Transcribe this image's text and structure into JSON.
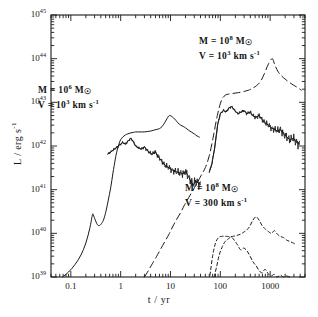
{
  "figure": {
    "title": "",
    "background_color": "#ffffff",
    "line_color": "#1a1a1a"
  },
  "axes": {
    "x": {
      "label": "t / yr",
      "scale": "log",
      "min": 0.04,
      "max": 5000,
      "tick_labels": [
        "0.1",
        "1",
        "10",
        "100",
        "1000"
      ],
      "tick_values": [
        0.1,
        1,
        10,
        100,
        1000
      ]
    },
    "y": {
      "label": "L / erg s",
      "label_exponent": "-1",
      "scale": "log",
      "min": 1e+39,
      "max": 1e+45,
      "tick_labels": [
        "10",
        "10",
        "10",
        "10",
        "10",
        "10",
        "10"
      ],
      "tick_exponents": [
        "39",
        "40",
        "41",
        "42",
        "43",
        "44",
        "45"
      ],
      "tick_values": [
        1e+39,
        1e+40,
        1e+41,
        1e+42,
        1e+43,
        1e+44,
        1e+45
      ]
    }
  },
  "annotations": [
    {
      "id": "left-model",
      "mass_prefix": "M  =  10",
      "mass_exponent": "6",
      "mass_unit": "M",
      "mass_unit_sub": "☉",
      "velocity_prefix": "V  =  10",
      "velocity_exponent": "3",
      "velocity_unit": "km s",
      "velocity_unit_exponent": "-1"
    },
    {
      "id": "top-right-model",
      "mass_prefix": "M  =  10",
      "mass_exponent": "8",
      "mass_unit": "M",
      "mass_unit_sub": "☉",
      "velocity_prefix": "V  =  10",
      "velocity_exponent": "3",
      "velocity_unit": "km s",
      "velocity_unit_exponent": "-1"
    },
    {
      "id": "lower-right-model",
      "mass_prefix": "M  =  10",
      "mass_exponent": "8",
      "mass_unit": "M",
      "mass_unit_sub": "☉",
      "velocity_prefix": "V  =  300",
      "velocity_exponent": "",
      "velocity_unit": "km s",
      "velocity_unit_exponent": "-1"
    }
  ],
  "chart_data": {
    "type": "line",
    "title": "",
    "xlabel": "t / yr",
    "ylabel": "L / erg s^-1",
    "xscale": "log",
    "yscale": "log",
    "xlim": [
      0.04,
      5000
    ],
    "ylim": [
      1e+39,
      1e+45
    ],
    "grid": false,
    "legend": "none (inline text annotations)",
    "series": [
      {
        "name": "M=1e6 Msun, V=1e3 km/s (smooth rise, solid)",
        "style": "solid",
        "x": [
          0.068,
          0.09,
          0.12,
          0.16,
          0.2,
          0.24,
          0.27,
          0.28,
          0.3,
          0.33,
          0.36,
          0.4,
          0.45,
          0.5,
          0.56,
          0.63,
          0.7,
          0.78,
          0.85,
          0.92,
          1.0,
          1.1,
          1.25,
          1.4,
          1.6,
          1.8,
          2.0,
          2.3,
          2.6,
          3.0,
          3.5,
          4.0,
          4.6,
          5.3,
          6.0,
          6.8,
          7.6,
          8.5,
          9.5,
          11,
          12,
          13,
          14,
          16,
          18,
          20,
          23,
          26,
          30,
          34,
          38
        ],
        "y": [
          1e+39,
          1.3e+39,
          1.9e+39,
          3.2e+39,
          6e+39,
          1.3e+40,
          2.6e+40,
          2.7e+40,
          2.2e+40,
          1.7e+40,
          1.5e+40,
          1.6e+40,
          2e+40,
          3e+40,
          5.5e+40,
          1.1e+41,
          2.4e+41,
          5e+41,
          8e+41,
          1.1e+42,
          1.4e+42,
          1.6e+42,
          1.8e+42,
          1.9e+42,
          2e+42,
          2.05e+42,
          2.1e+42,
          2.1e+42,
          2.1e+42,
          2.1e+42,
          2.15e+42,
          2.2e+42,
          2.3e+42,
          2.4e+42,
          2.5e+42,
          2.8e+42,
          3.4e+42,
          4.2e+42,
          5e+42,
          4.6e+42,
          4.2e+42,
          3.8e+42,
          3.4e+42,
          3e+42,
          2.8e+42,
          2.6e+42,
          2.3e+42,
          2.1e+42,
          1.9e+42,
          1.7e+42,
          1.6e+42
        ]
      },
      {
        "name": "M=1e6 Msun, V=1e3 km/s (jagged, solid)",
        "style": "solid-jagged",
        "x": [
          0.55,
          0.65,
          0.75,
          0.85,
          0.95,
          1.1,
          1.25,
          1.4,
          1.6,
          1.8,
          2.0,
          2.3,
          2.6,
          3.0,
          3.4,
          3.8,
          4.3,
          4.9,
          5.5,
          6.2,
          7.0,
          7.8,
          8.8,
          10,
          11,
          12.5,
          14,
          16,
          18,
          20,
          23,
          26,
          29,
          32,
          36,
          40
        ],
        "y": [
          6.5e+41,
          7.5e+41,
          8.5e+41,
          9.5e+41,
          1.05e+42,
          1.2e+42,
          1.1e+42,
          1.3e+42,
          1.5e+42,
          1.25e+42,
          1e+42,
          9e+41,
          8.5e+41,
          9.5e+41,
          8e+41,
          7e+41,
          6.5e+41,
          7.5e+41,
          6e+41,
          5e+41,
          4.2e+41,
          3.6e+41,
          3.3e+41,
          3e+41,
          2.8e+41,
          2.6e+41,
          2.5e+41,
          2.4e+41,
          2.3e+41,
          2.6e+41,
          2e+41,
          1.5e+41,
          1.3e+41,
          1.6e+41,
          1.4e+41,
          1.3e+41
        ]
      },
      {
        "name": "M=1e8 Msun, V=1e3 km/s (long-dashed)",
        "style": "long-dashed",
        "x": [
          3.0,
          3.6,
          4.3,
          5.2,
          6.3,
          7.6,
          9.2,
          11,
          13,
          16,
          19,
          23,
          28,
          34,
          41,
          50,
          60,
          72,
          87,
          105,
          125,
          150,
          180,
          215,
          260,
          310,
          370,
          440,
          530,
          640,
          770,
          920,
          1100,
          1250,
          1450,
          1700,
          2000,
          2400,
          2900,
          3500,
          4200
        ],
        "y": [
          1e+39,
          1.4e+39,
          2e+39,
          2.9e+39,
          4.3e+39,
          6.3e+39,
          9.3e+39,
          1.4e+40,
          2e+40,
          3e+40,
          4.4e+40,
          6.5e+40,
          9.5e+40,
          1.4e+41,
          2.1e+41,
          3.2e+41,
          6e+41,
          1.6e+42,
          5e+42,
          1.1e+43,
          1.45e+43,
          1.55e+43,
          1.6e+43,
          1.65e+43,
          1.7e+43,
          1.8e+43,
          1.9e+43,
          2.1e+43,
          2.4e+43,
          3e+43,
          4.6e+43,
          7.5e+43,
          1e+44,
          7e+43,
          5e+43,
          4e+43,
          3.4e+43,
          2.9e+43,
          2.5e+43,
          2.2e+43,
          1.9e+43
        ]
      },
      {
        "name": "M=1e8 Msun, V=1e3 km/s (jagged upper, solid)",
        "style": "solid-jagged",
        "x": [
          60,
          68,
          78,
          88,
          100,
          115,
          130,
          150,
          170,
          195,
          225,
          260,
          300,
          340,
          390,
          450,
          520,
          600,
          690,
          800,
          920,
          1060,
          1220,
          1400,
          1600,
          1850,
          2150,
          2500,
          2900,
          3400,
          3900
        ],
        "y": [
          2.5e+41,
          4e+41,
          1e+42,
          3e+42,
          5.5e+42,
          6.5e+42,
          6e+42,
          7.5e+42,
          8e+42,
          6.5e+42,
          5.5e+42,
          6e+42,
          6.5e+42,
          5.5e+42,
          6e+42,
          5e+42,
          4.5e+42,
          5e+42,
          4e+42,
          3.4e+42,
          3e+42,
          2.6e+42,
          2.4e+42,
          2.2e+42,
          2.4e+42,
          1.9e+42,
          1.6e+42,
          1.4e+42,
          1.5e+42,
          1.2e+42,
          1.1e+42
        ]
      },
      {
        "name": "M=1e8 Msun, V=300 km/s (upper dashed)",
        "style": "short-dashed",
        "x": [
          62,
          70,
          80,
          92,
          105,
          120,
          140,
          160,
          185,
          215,
          250,
          290,
          340,
          390,
          450,
          520,
          600,
          690,
          800,
          920,
          1060,
          1220,
          1400,
          1600,
          1850,
          2150,
          2500,
          2900,
          3300
        ],
        "y": [
          1.1e+39,
          3e+39,
          6e+39,
          8e+39,
          8.5e+39,
          8.6e+39,
          8.5e+39,
          8.4e+39,
          8.6e+39,
          9e+39,
          9.5e+39,
          1.05e+40,
          1.2e+40,
          1.45e+40,
          2e+40,
          2.4e+40,
          2e+40,
          1.5e+40,
          1.25e+40,
          1.1e+40,
          1e+40,
          1.15e+40,
          9.5e+39,
          8.5e+39,
          8e+39,
          7e+39,
          6.5e+39,
          6e+39,
          5.5e+39
        ]
      },
      {
        "name": "M=1e8 Msun, V=300 km/s (lower dashed)",
        "style": "short-dashed",
        "x": [
          75,
          85,
          95,
          110,
          125,
          145,
          165,
          190,
          220,
          255,
          295,
          340,
          395,
          455,
          525,
          600,
          690,
          790,
          910,
          1050,
          1200,
          1380,
          1600,
          1850,
          2150,
          2500
        ],
        "y": [
          1e+39,
          1.8e+39,
          3.2e+39,
          5e+39,
          6.5e+39,
          7.5e+39,
          8.2e+39,
          7e+39,
          5.5e+39,
          4.2e+39,
          4.6e+39,
          4e+39,
          3e+39,
          2.2e+39,
          1.8e+39,
          1.4e+39,
          1.25e+39,
          1.5e+39,
          1.2e+39,
          1.05e+39,
          1.15e+39,
          1e+39,
          1.1e+39,
          1e+39,
          1.05e+39,
          1e+39
        ]
      }
    ]
  }
}
